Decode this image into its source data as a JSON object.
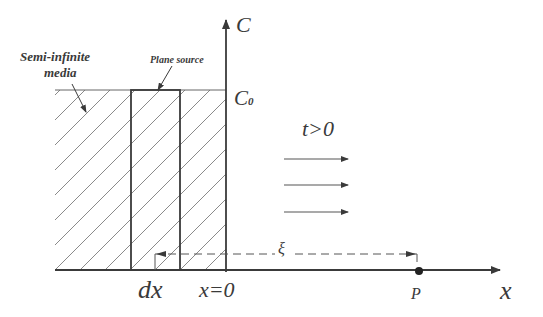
{
  "diagram": {
    "labels": {
      "semi_infinite_line1": "Semi-infinite",
      "semi_infinite_line2": "media",
      "plane_source": "Plane source",
      "c_axis": "C",
      "c0": "C",
      "c0_sub": "0",
      "time": "t>0",
      "xi": "ξ",
      "dx": "dx",
      "x_zero": "x=0",
      "point_p": "P",
      "x_axis": "x"
    },
    "colors": {
      "stroke": "#3a3a3a",
      "hatch": "#7a7a7a",
      "dashed": "#555555",
      "background": "#ffffff"
    },
    "elements": {
      "flow_arrows_count": 3,
      "hatch_region": "semi-infinite media x<0 up to C0",
      "plane_source_strip": "width dx",
      "distance_marker": "dashed ξ from dx to P"
    }
  }
}
